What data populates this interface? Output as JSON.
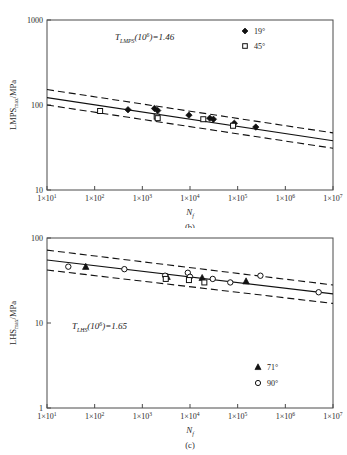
{
  "figure": {
    "background_color": "#ffffff",
    "line_color": "#111111",
    "axis_color": "#4a4a4a"
  },
  "chart_data": [
    {
      "type": "scatter",
      "panel": "b",
      "caption": "(b)",
      "title": "",
      "xlabel": "N_f",
      "xlabel_base": "N",
      "xlabel_sub": "f",
      "ylabel": "LMPS_max/MPa",
      "ylabel_base": "LMPS",
      "ylabel_sub": "max",
      "ylabel_unit": "/MPa",
      "xscale": "log",
      "yscale": "log",
      "xlim": [
        10,
        10000000
      ],
      "ylim": [
        10,
        1000
      ],
      "grid": false,
      "xticks": [
        {
          "value": 10,
          "label": "1×10",
          "exp": "1"
        },
        {
          "value": 100,
          "label": "1×10",
          "exp": "2"
        },
        {
          "value": 1000,
          "label": "1×10",
          "exp": "3"
        },
        {
          "value": 10000,
          "label": "1×10",
          "exp": "4"
        },
        {
          "value": 100000,
          "label": "1×10",
          "exp": "5"
        },
        {
          "value": 1000000,
          "label": "1×10",
          "exp": "6"
        },
        {
          "value": 10000000,
          "label": "1×10",
          "exp": "7"
        }
      ],
      "yticks": [
        {
          "value": 10,
          "label": "10"
        },
        {
          "value": 100,
          "label": "100"
        },
        {
          "value": 1000,
          "label": "1000"
        }
      ],
      "annotation": {
        "prefix": "T",
        "subscript": "LMPS",
        "paren_open": "(10",
        "superscript": "6",
        "paren_close": ")",
        "equals": "=1.46",
        "full_text": "T_LMPS(10^6)=1.46"
      },
      "legend": {
        "position": "top-right",
        "entries": [
          {
            "label": "19°",
            "marker": "filled-diamond",
            "series": "19deg"
          },
          {
            "label": "45°",
            "marker": "open-square",
            "series": "45deg"
          }
        ]
      },
      "fit_line": {
        "name": "mean-fit",
        "style": "solid",
        "points": [
          {
            "x": 10,
            "y": 122
          },
          {
            "x": 10000000,
            "y": 38
          }
        ]
      },
      "bound_lines": [
        {
          "name": "upper-bound",
          "style": "dashed",
          "points": [
            {
              "x": 10,
              "y": 152
            },
            {
              "x": 10000000,
              "y": 47
            }
          ]
        },
        {
          "name": "lower-bound",
          "style": "dashed",
          "points": [
            {
              "x": 10,
              "y": 100
            },
            {
              "x": 10000000,
              "y": 31
            }
          ]
        }
      ],
      "series": [
        {
          "name": "19°",
          "marker": "filled-diamond",
          "points": [
            {
              "x": 500,
              "y": 88
            },
            {
              "x": 1800,
              "y": 91
            },
            {
              "x": 2100,
              "y": 86
            },
            {
              "x": 9500,
              "y": 76
            },
            {
              "x": 26000,
              "y": 70
            },
            {
              "x": 31000,
              "y": 68
            },
            {
              "x": 85000,
              "y": 61
            },
            {
              "x": 240000,
              "y": 55
            }
          ]
        },
        {
          "name": "45°",
          "marker": "open-square",
          "points": [
            {
              "x": 130,
              "y": 85
            },
            {
              "x": 2000,
              "y": 73
            },
            {
              "x": 2100,
              "y": 70
            },
            {
              "x": 19000,
              "y": 68
            },
            {
              "x": 80000,
              "y": 57
            }
          ]
        }
      ]
    },
    {
      "type": "scatter",
      "panel": "c",
      "caption": "(c)",
      "title": "",
      "xlabel": "N_f",
      "xlabel_base": "N",
      "xlabel_sub": "f",
      "ylabel": "LHS_max/MPa",
      "ylabel_base": "LHS",
      "ylabel_sub": "max",
      "ylabel_unit": "/MPa",
      "xscale": "log",
      "yscale": "log",
      "xlim": [
        10,
        10000000
      ],
      "ylim": [
        1,
        100
      ],
      "grid": false,
      "xticks": [
        {
          "value": 10,
          "label": "1×10",
          "exp": "1"
        },
        {
          "value": 100,
          "label": "1×10",
          "exp": "2"
        },
        {
          "value": 1000,
          "label": "1×10",
          "exp": "3"
        },
        {
          "value": 10000,
          "label": "1×10",
          "exp": "4"
        },
        {
          "value": 100000,
          "label": "1×10",
          "exp": "5"
        },
        {
          "value": 1000000,
          "label": "1×10",
          "exp": "6"
        },
        {
          "value": 10000000,
          "label": "1×10",
          "exp": "7"
        }
      ],
      "yticks": [
        {
          "value": 1,
          "label": "1"
        },
        {
          "value": 10,
          "label": "10"
        },
        {
          "value": 100,
          "label": "100"
        }
      ],
      "annotation": {
        "prefix": "T",
        "subscript": "LHS",
        "paren_open": "(10",
        "superscript": "6",
        "paren_close": ")",
        "equals": "=1.65",
        "full_text": "T_LHS(10^6)=1.65"
      },
      "legend": {
        "position": "bottom-right",
        "entries": [
          {
            "label": "71°",
            "marker": "filled-triangle",
            "series": "71deg"
          },
          {
            "label": "90°",
            "marker": "open-circle",
            "series": "90deg"
          }
        ]
      },
      "fit_line": {
        "name": "mean-fit",
        "style": "solid",
        "points": [
          {
            "x": 10,
            "y": 55
          },
          {
            "x": 10000000,
            "y": 22
          }
        ]
      },
      "bound_lines": [
        {
          "name": "upper-bound",
          "style": "dashed",
          "points": [
            {
              "x": 10,
              "y": 72
            },
            {
              "x": 10000000,
              "y": 28
            }
          ]
        },
        {
          "name": "lower-bound",
          "style": "dashed",
          "points": [
            {
              "x": 10,
              "y": 42
            },
            {
              "x": 10000000,
              "y": 17
            }
          ]
        }
      ],
      "series": [
        {
          "name": "71°",
          "marker": "filled-triangle",
          "points": [
            {
              "x": 65,
              "y": 46
            },
            {
              "x": 3300,
              "y": 35
            },
            {
              "x": 18000,
              "y": 34
            },
            {
              "x": 150000,
              "y": 31
            }
          ]
        },
        {
          "name": "90°",
          "marker": "open-circle",
          "points": [
            {
              "x": 28,
              "y": 46
            },
            {
              "x": 420,
              "y": 43
            },
            {
              "x": 3000,
              "y": 36
            },
            {
              "x": 9000,
              "y": 39
            },
            {
              "x": 10000,
              "y": 35
            },
            {
              "x": 30000,
              "y": 33
            },
            {
              "x": 70000,
              "y": 30
            },
            {
              "x": 300000,
              "y": 36
            },
            {
              "x": 5000000,
              "y": 23
            }
          ]
        },
        {
          "name": "45°-overlay",
          "marker": "open-square",
          "points": [
            {
              "x": 3100,
              "y": 33
            },
            {
              "x": 9500,
              "y": 32
            },
            {
              "x": 20000,
              "y": 30
            }
          ]
        }
      ]
    }
  ]
}
